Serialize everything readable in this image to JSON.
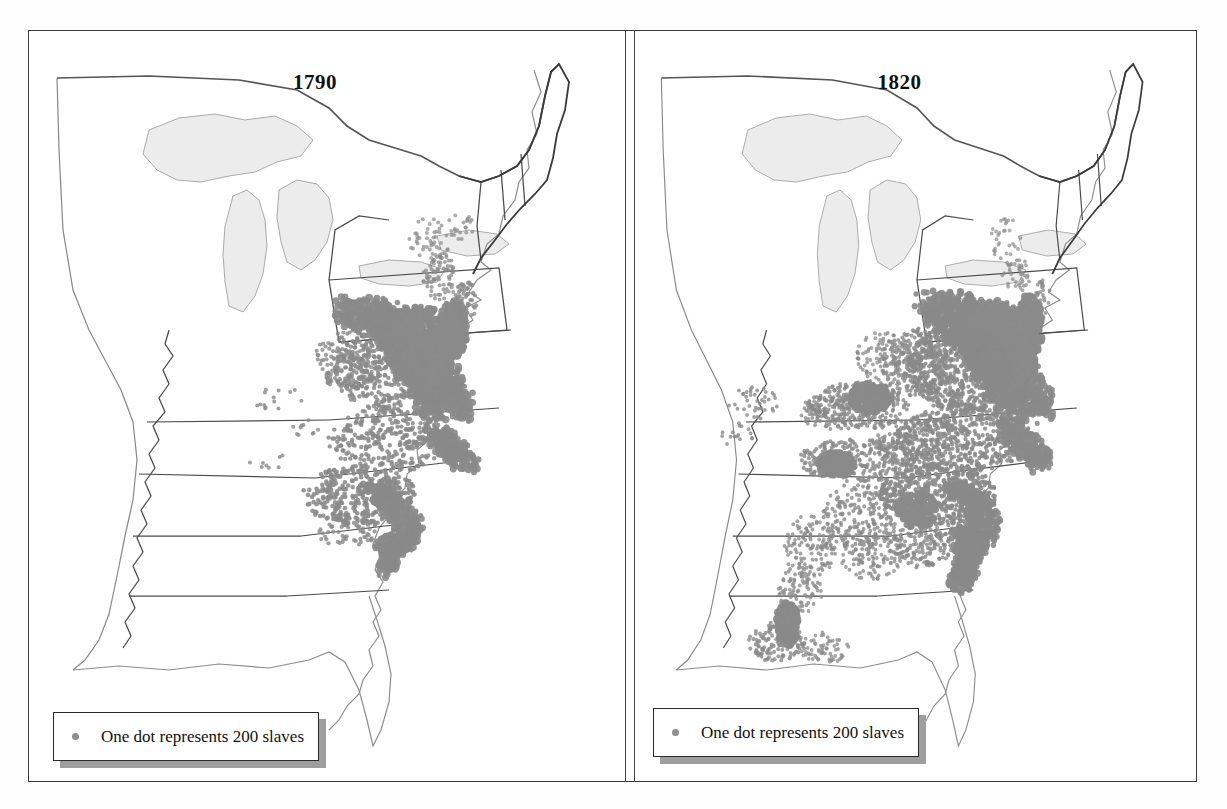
{
  "figure": {
    "kind": "dot-density-map-pair",
    "panels": [
      {
        "id": "1790",
        "title": "1790",
        "legend": {
          "text": "One dot represents 200 slaves",
          "dot_label": "legend-dot",
          "dot_value": 200
        }
      },
      {
        "id": "1820",
        "title": "1820",
        "legend": {
          "text": "One dot represents 200 slaves",
          "dot_label": "legend-dot",
          "dot_value": 200
        }
      }
    ]
  },
  "colors": {
    "frame": "#3a3a3a",
    "state_border": "#4a4a4a",
    "coast_line": "#8d8d8d",
    "lake_fill": "#ececec",
    "lake_line": "#aaaaaa",
    "dot": "#8a8a8a",
    "dense_fill": "#8a8a8a",
    "legend_shadow": "#9e9e9e",
    "background": "#ffffff",
    "text": "#111111"
  },
  "chart_data": {
    "type": "scatter",
    "subtitle": "",
    "xlabel": "",
    "ylabel": "",
    "legend_position": "bottom-left",
    "grid": false,
    "dot_value": 200,
    "panels": [
      {
        "year": 1790,
        "regions": [
          {
            "name": "Chesapeake Tidewater (Maryland / Eastern Virginia)",
            "density": "solid",
            "dots": 900
          },
          {
            "name": "Virginia Piedmont",
            "density": "high",
            "dots": 420
          },
          {
            "name": "North Carolina Coastal Plain",
            "density": "medium",
            "dots": 300
          },
          {
            "name": "South Carolina Low Country",
            "density": "solid",
            "dots": 260
          },
          {
            "name": "South Carolina Upcountry",
            "density": "high",
            "dots": 240
          },
          {
            "name": "Georgia Coast",
            "density": "medium",
            "dots": 90
          },
          {
            "name": "Delaware",
            "density": "medium",
            "dots": 40
          },
          {
            "name": "New Jersey / Hudson Valley New York",
            "density": "low",
            "dots": 70
          },
          {
            "name": "Southwest Territory (Tennessee)",
            "density": "sparse",
            "dots": 12
          },
          {
            "name": "Kentucky",
            "density": "sparse",
            "dots": 18
          }
        ]
      },
      {
        "year": 1820,
        "regions": [
          {
            "name": "Chesapeake Tidewater (Maryland / Eastern Virginia)",
            "density": "solid",
            "dots": 1000
          },
          {
            "name": "Virginia Piedmont",
            "density": "high",
            "dots": 760
          },
          {
            "name": "North Carolina",
            "density": "high",
            "dots": 620
          },
          {
            "name": "South Carolina Low Country",
            "density": "solid",
            "dots": 420
          },
          {
            "name": "South Carolina / Georgia Upcountry",
            "density": "high",
            "dots": 520
          },
          {
            "name": "Georgia Coast and Savannah River",
            "density": "solid",
            "dots": 330
          },
          {
            "name": "Kentucky Bluegrass",
            "density": "high",
            "dots": 300
          },
          {
            "name": "Tennessee (Nashville Basin)",
            "density": "high",
            "dots": 280
          },
          {
            "name": "Alabama",
            "density": "medium",
            "dots": 230
          },
          {
            "name": "Mississippi (Natchez District)",
            "density": "medium",
            "dots": 170
          },
          {
            "name": "Louisiana (Lower Mississippi / Baton Rouge)",
            "density": "solid",
            "dots": 200
          },
          {
            "name": "Missouri",
            "density": "sparse",
            "dots": 40
          },
          {
            "name": "Delaware / New Jersey",
            "density": "low",
            "dots": 45
          }
        ]
      }
    ]
  }
}
